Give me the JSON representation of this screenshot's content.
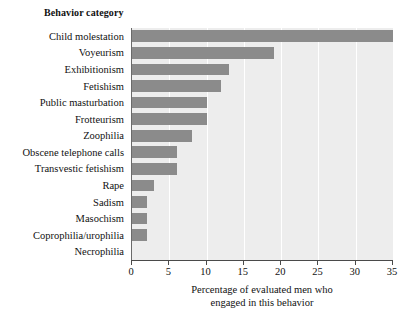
{
  "chart_data": {
    "type": "bar",
    "orientation": "horizontal",
    "title": "",
    "category_axis_title": "Behavior category",
    "xlabel_line1": "Percentage of evaluated men who",
    "xlabel_line2": "engaged in this behavior",
    "ylabel": "Behavior category",
    "xlim": [
      0,
      35
    ],
    "xticks": [
      0,
      5,
      10,
      15,
      20,
      25,
      30,
      35
    ],
    "xtick_labels": [
      "0",
      "5",
      "10",
      "15",
      "20",
      "25",
      "30",
      "35"
    ],
    "grid": "vertical-white",
    "legend": "none",
    "categories": [
      "Child molestation",
      "Voyeurism",
      "Exhibitionism",
      "Fetishism",
      "Public masturbation",
      "Frotteurism",
      "Zoophilia",
      "Obscene telephone calls",
      "Transvestic fetishism",
      "Rape",
      "Sadism",
      "Masochism",
      "Coprophilia/urophilia",
      "Necrophilia"
    ],
    "values": [
      35,
      19,
      13,
      12,
      10,
      10,
      8,
      6,
      6,
      3,
      2,
      2,
      2,
      0
    ],
    "bar_color": "#8b8b8b",
    "plot_background": "#ededed",
    "gridline_color": "#ffffff"
  }
}
